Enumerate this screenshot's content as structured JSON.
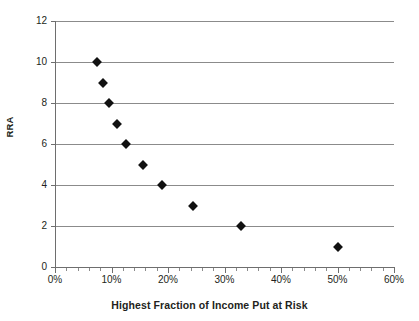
{
  "chart_data": {
    "type": "scatter",
    "title": "",
    "xlabel": "Highest Fraction of Income Put at Risk",
    "ylabel": "RRA",
    "xlim": [
      0,
      60
    ],
    "ylim": [
      0,
      12
    ],
    "grid": true,
    "legend": false,
    "x_tick_labels": [
      "0%",
      "10%",
      "20%",
      "30%",
      "40%",
      "50%",
      "60%"
    ],
    "x_tick_values": [
      0,
      10,
      20,
      30,
      40,
      50,
      60
    ],
    "x_minor_tick_count_between": 4,
    "y_tick_labels": [
      "0",
      "2",
      "4",
      "6",
      "8",
      "10",
      "12"
    ],
    "y_tick_values": [
      0,
      2,
      4,
      6,
      8,
      10,
      12
    ],
    "marker": "diamond",
    "marker_color": "#111111",
    "grid_color": "#8b8b8b",
    "x": [
      7.5,
      8.5,
      9.5,
      11.0,
      12.5,
      15.5,
      19.0,
      24.5,
      33.0,
      50.0
    ],
    "y": [
      10,
      9,
      8,
      7,
      6,
      5,
      4,
      3,
      2,
      1
    ],
    "points": [
      {
        "x": 7.5,
        "y": 10
      },
      {
        "x": 8.5,
        "y": 9
      },
      {
        "x": 9.5,
        "y": 8
      },
      {
        "x": 11.0,
        "y": 7
      },
      {
        "x": 12.5,
        "y": 6
      },
      {
        "x": 15.5,
        "y": 5
      },
      {
        "x": 19.0,
        "y": 4
      },
      {
        "x": 24.5,
        "y": 3
      },
      {
        "x": 33.0,
        "y": 2
      },
      {
        "x": 50.0,
        "y": 1
      }
    ]
  }
}
